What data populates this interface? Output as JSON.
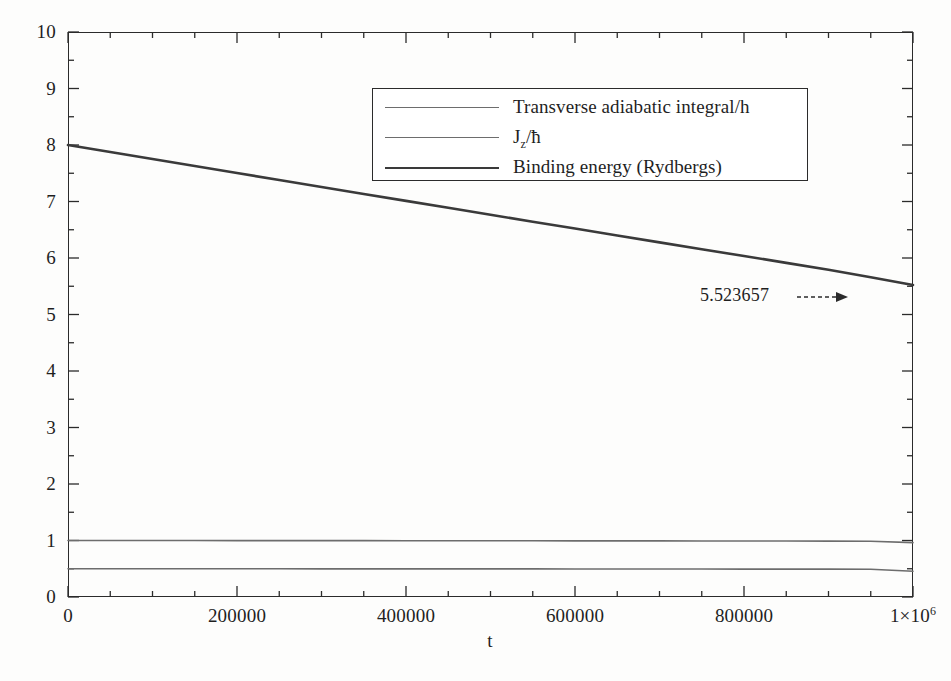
{
  "figure": {
    "background_color": "#fdfdfc",
    "frame_color": "#2b2b2b"
  },
  "axes": {
    "x": {
      "title": "t",
      "tick_labels": [
        "0",
        "200000",
        "400000",
        "600000",
        "800000",
        "1×10⁶"
      ],
      "tick_values": [
        0,
        200000,
        400000,
        600000,
        800000,
        1000000
      ],
      "minor_tick_step": 50000,
      "min": 0,
      "max": 1000000
    },
    "y": {
      "title": "",
      "tick_labels": [
        "0",
        "1",
        "2",
        "3",
        "4",
        "5",
        "6",
        "7",
        "8",
        "9",
        "10"
      ],
      "tick_values": [
        0,
        1,
        2,
        3,
        4,
        5,
        6,
        7,
        8,
        9,
        10
      ],
      "minor_tick_step": 0.5,
      "min": 0,
      "max": 10
    }
  },
  "legend": {
    "position": "top-center",
    "entries": [
      {
        "label": "Transverse adiabatic integral/h",
        "color": "#6d6d6d",
        "width": 1.6
      },
      {
        "label": "J",
        "label_sub": "z",
        "label_tail": "/ħ",
        "color": "#6d6d6d",
        "width": 1.6
      },
      {
        "label": "Binding energy (Rydbergs)",
        "color": "#3a3a3a",
        "width": 2.6
      }
    ]
  },
  "annotation": {
    "text": "5.523657",
    "arrow": "dashed-right-arrow"
  },
  "chart_data": {
    "type": "line",
    "title": "",
    "xlabel": "t",
    "ylabel": "",
    "xlim": [
      0,
      1000000
    ],
    "ylim": [
      0,
      10
    ],
    "grid": false,
    "legend_position": "top-center",
    "x": [
      0,
      50000,
      100000,
      150000,
      200000,
      250000,
      300000,
      350000,
      400000,
      450000,
      500000,
      550000,
      600000,
      650000,
      700000,
      750000,
      800000,
      850000,
      900000,
      950000,
      1000000
    ],
    "series": [
      {
        "name": "Transverse adiabatic integral/h",
        "color": "#6d6d6d",
        "width": 1.6,
        "values": [
          1.0,
          1.0,
          0.999,
          0.999,
          0.998,
          0.998,
          0.997,
          0.997,
          0.996,
          0.996,
          0.995,
          0.995,
          0.994,
          0.993,
          0.993,
          0.992,
          0.991,
          0.99,
          0.989,
          0.987,
          0.962
        ]
      },
      {
        "name": "J_z/ħ",
        "color": "#6d6d6d",
        "width": 1.6,
        "values": [
          0.5,
          0.5,
          0.5,
          0.499,
          0.499,
          0.499,
          0.498,
          0.498,
          0.498,
          0.497,
          0.497,
          0.497,
          0.496,
          0.496,
          0.495,
          0.495,
          0.494,
          0.494,
          0.493,
          0.492,
          0.455
        ]
      },
      {
        "name": "Binding energy (Rydbergs)",
        "color": "#3a3a3a",
        "width": 2.6,
        "values": [
          8.0,
          7.876,
          7.752,
          7.628,
          7.504,
          7.381,
          7.257,
          7.134,
          7.011,
          6.888,
          6.765,
          6.643,
          6.521,
          6.399,
          6.277,
          6.156,
          6.035,
          5.914,
          5.793,
          5.658,
          5.523657
        ]
      }
    ],
    "annotations": [
      {
        "text": "5.523657",
        "x": 820000,
        "y": 5.3,
        "style": "dashed-arrow-right"
      }
    ]
  }
}
